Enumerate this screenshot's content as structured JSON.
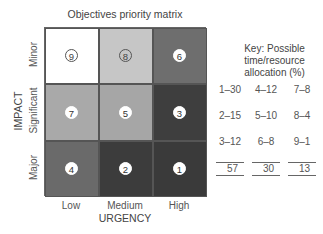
{
  "title": "Objectives priority matrix",
  "axes": {
    "y_label": "IMPACT",
    "x_label": "URGENCY",
    "rows": [
      "Minor",
      "Significant",
      "Major"
    ],
    "cols": [
      "Low",
      "Medium",
      "High"
    ]
  },
  "cells": [
    {
      "row": "Minor",
      "col": "Low",
      "rank": "9",
      "color": "#ffffff",
      "style": "light"
    },
    {
      "row": "Minor",
      "col": "Medium",
      "rank": "8",
      "color": "#c6c6c6",
      "style": "light"
    },
    {
      "row": "Minor",
      "col": "High",
      "rank": "6",
      "color": "#6e6e6e",
      "style": "dark"
    },
    {
      "row": "Significant",
      "col": "Low",
      "rank": "7",
      "color": "#a9a9a9",
      "style": "dark"
    },
    {
      "row": "Significant",
      "col": "Medium",
      "rank": "5",
      "color": "#a6a6a6",
      "style": "dark"
    },
    {
      "row": "Significant",
      "col": "High",
      "rank": "3",
      "color": "#3e3e3e",
      "style": "dark"
    },
    {
      "row": "Major",
      "col": "Low",
      "rank": "4",
      "color": "#6a6a6a",
      "style": "dark"
    },
    {
      "row": "Major",
      "col": "Medium",
      "rank": "2",
      "color": "#3c3c3c",
      "style": "dark"
    },
    {
      "row": "Major",
      "col": "High",
      "rank": "1",
      "color": "#3a3a3a",
      "style": "dark"
    }
  ],
  "key": {
    "heading_line1": "Key: Possible",
    "heading_line2": "time/resource",
    "heading_line3": "allocation (%)",
    "rows": [
      [
        "1–30",
        "4–12",
        "7–8"
      ],
      [
        "2–15",
        "5–10",
        "8–4"
      ],
      [
        "3–12",
        "6–8",
        "9–1"
      ]
    ],
    "totals": [
      "57",
      "30",
      "13"
    ]
  }
}
